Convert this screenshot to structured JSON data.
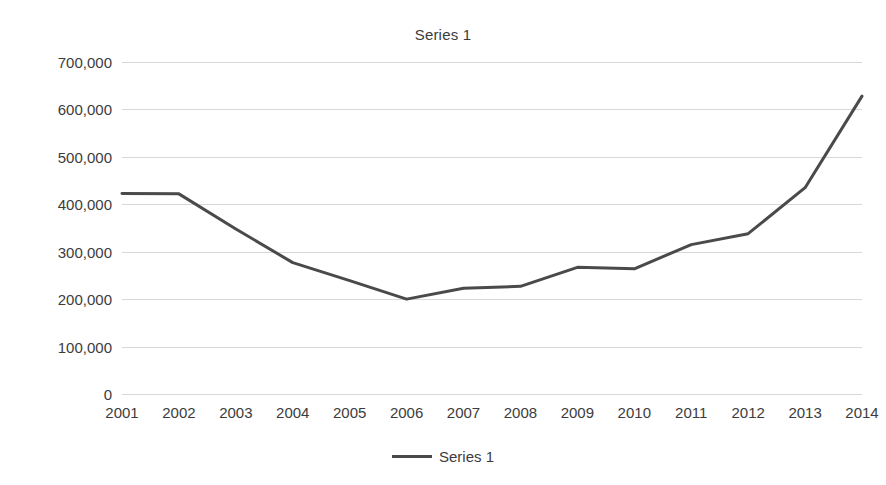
{
  "chart_data": {
    "type": "line",
    "title": "Series 1",
    "xlabel": "",
    "ylabel": "",
    "categories": [
      "2001",
      "2002",
      "2003",
      "2004",
      "2005",
      "2006",
      "2007",
      "2008",
      "2009",
      "2010",
      "2011",
      "2012",
      "2013",
      "2014"
    ],
    "series": [
      {
        "name": "Series 1",
        "color": "#4a4a4a",
        "values": [
          423000,
          422000,
          348000,
          277000,
          239000,
          200000,
          223000,
          227000,
          267000,
          264000,
          315000,
          338000,
          435000,
          628000
        ]
      }
    ],
    "ylim": [
      0,
      700000
    ],
    "ytick_values": [
      700000,
      600000,
      500000,
      400000,
      300000,
      200000,
      100000,
      0
    ],
    "ytick_labels": [
      "700,000",
      "600,000",
      "500,000",
      "400,000",
      "300,000",
      "200,000",
      "100,000",
      "0"
    ],
    "grid": true,
    "grid_color": "#d8d8d8",
    "legend_position": "bottom",
    "legend_entries": [
      "Series 1"
    ],
    "background": "#ffffff"
  }
}
